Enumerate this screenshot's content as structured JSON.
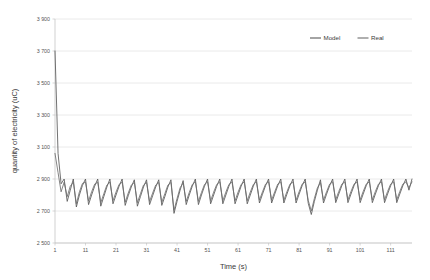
{
  "chart_data": {
    "type": "line",
    "title": "",
    "xlabel": "Time (s)",
    "ylabel": "quantity of electricity (uC)",
    "xlim": [
      1,
      118
    ],
    "ylim": [
      2500,
      3900
    ],
    "ytick_step": 200,
    "grid": "horizontal",
    "legend_position": "top-right",
    "xticks": [
      1,
      11,
      21,
      31,
      41,
      51,
      61,
      71,
      81,
      91,
      101,
      111
    ],
    "xtick_labels": [
      "1",
      "11",
      "21",
      "31",
      "41",
      "51",
      "61",
      "71",
      "81",
      "91",
      "101",
      "111"
    ],
    "yticks": [
      2500,
      2700,
      2900,
      3100,
      3300,
      3500,
      3700,
      3900
    ],
    "ytick_labels": [
      "2 500",
      "2 700",
      "2 900",
      "3 100",
      "3 300",
      "3 500",
      "3 700",
      "3 900"
    ],
    "series": [
      {
        "name": "Model",
        "color": "#595959",
        "x": [
          1,
          2,
          3,
          4,
          5,
          6,
          7,
          8,
          9,
          10,
          11,
          12,
          13,
          14,
          15,
          16,
          17,
          18,
          19,
          20,
          21,
          22,
          23,
          24,
          25,
          26,
          27,
          28,
          29,
          30,
          31,
          32,
          33,
          34,
          35,
          36,
          37,
          38,
          39,
          40,
          41,
          42,
          43,
          44,
          45,
          46,
          47,
          48,
          49,
          50,
          51,
          52,
          53,
          54,
          55,
          56,
          57,
          58,
          59,
          60,
          61,
          62,
          63,
          64,
          65,
          66,
          67,
          68,
          69,
          70,
          71,
          72,
          73,
          74,
          75,
          76,
          77,
          78,
          79,
          80,
          81,
          82,
          83,
          84,
          85,
          86,
          87,
          88,
          89,
          90,
          91,
          92,
          93,
          94,
          95,
          96,
          97,
          98,
          99,
          100,
          101,
          102,
          103,
          104,
          105,
          106,
          107,
          108,
          109,
          110,
          111,
          112,
          113,
          114,
          115,
          116,
          117,
          118
        ],
        "values": [
          3700,
          3060,
          2870,
          2900,
          2760,
          2830,
          2900,
          2725,
          2800,
          2860,
          2900,
          2740,
          2800,
          2855,
          2900,
          2730,
          2790,
          2850,
          2900,
          2745,
          2800,
          2855,
          2900,
          2735,
          2795,
          2850,
          2895,
          2730,
          2790,
          2850,
          2895,
          2740,
          2795,
          2850,
          2895,
          2735,
          2790,
          2850,
          2895,
          2685,
          2760,
          2830,
          2890,
          2740,
          2800,
          2855,
          2900,
          2740,
          2800,
          2855,
          2900,
          2745,
          2800,
          2855,
          2900,
          2745,
          2800,
          2855,
          2900,
          2745,
          2800,
          2855,
          2900,
          2745,
          2800,
          2855,
          2900,
          2750,
          2805,
          2858,
          2900,
          2750,
          2805,
          2858,
          2900,
          2750,
          2805,
          2858,
          2900,
          2750,
          2805,
          2858,
          2900,
          2748,
          2678,
          2760,
          2830,
          2895,
          2750,
          2805,
          2858,
          2900,
          2752,
          2806,
          2858,
          2900,
          2752,
          2806,
          2858,
          2900,
          2752,
          2806,
          2858,
          2900,
          2752,
          2806,
          2858,
          2900,
          2752,
          2806,
          2858,
          2900,
          2752,
          2806,
          2858,
          2900,
          2830,
          2900
        ]
      },
      {
        "name": "Real",
        "color": "#6e6e6e",
        "x": [
          1,
          2,
          3,
          4,
          5,
          6,
          7,
          8,
          9,
          10,
          11,
          12,
          13,
          14,
          15,
          16,
          17,
          18,
          19,
          20,
          21,
          22,
          23,
          24,
          25,
          26,
          27,
          28,
          29,
          30,
          31,
          32,
          33,
          34,
          35,
          36,
          37,
          38,
          39,
          40,
          41,
          42,
          43,
          44,
          45,
          46,
          47,
          48,
          49,
          50,
          51,
          52,
          53,
          54,
          55,
          56,
          57,
          58,
          59,
          60,
          61,
          62,
          63,
          64,
          65,
          66,
          67,
          68,
          69,
          70,
          71,
          72,
          73,
          74,
          75,
          76,
          77,
          78,
          79,
          80,
          81,
          82,
          83,
          84,
          85,
          86,
          87,
          88,
          89,
          90,
          91,
          92,
          93,
          94,
          95,
          96,
          97,
          98,
          99,
          100,
          101,
          102,
          103,
          104,
          105,
          106,
          107,
          108,
          109,
          110,
          111,
          112,
          113,
          114,
          115,
          116,
          117,
          118
        ],
        "values": [
          3060,
          2940,
          2820,
          2880,
          2790,
          2855,
          2880,
          2745,
          2820,
          2872,
          2880,
          2762,
          2820,
          2868,
          2880,
          2752,
          2808,
          2862,
          2880,
          2765,
          2818,
          2866,
          2880,
          2755,
          2812,
          2862,
          2878,
          2752,
          2808,
          2862,
          2878,
          2760,
          2812,
          2862,
          2878,
          2755,
          2808,
          2862,
          2878,
          2705,
          2778,
          2845,
          2875,
          2760,
          2816,
          2866,
          2882,
          2760,
          2816,
          2866,
          2882,
          2764,
          2818,
          2866,
          2882,
          2764,
          2818,
          2866,
          2882,
          2764,
          2818,
          2866,
          2882,
          2764,
          2818,
          2866,
          2882,
          2768,
          2820,
          2868,
          2882,
          2768,
          2820,
          2868,
          2882,
          2768,
          2820,
          2868,
          2882,
          2768,
          2820,
          2868,
          2882,
          2766,
          2700,
          2778,
          2845,
          2878,
          2768,
          2820,
          2868,
          2882,
          2770,
          2822,
          2868,
          2882,
          2770,
          2822,
          2868,
          2882,
          2770,
          2822,
          2868,
          2882,
          2770,
          2822,
          2868,
          2882,
          2770,
          2822,
          2868,
          2882,
          2770,
          2822,
          2868,
          2882,
          2845,
          2882
        ]
      }
    ],
    "legend": [
      {
        "label": "Model",
        "color": "#595959"
      },
      {
        "label": "Real",
        "color": "#6e6e6e"
      }
    ]
  }
}
